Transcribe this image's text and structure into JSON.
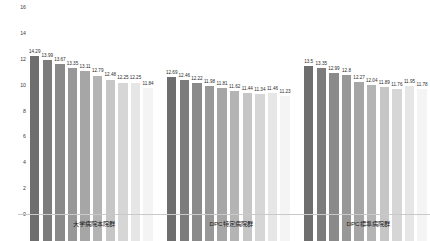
{
  "chart_data": {
    "type": "bar",
    "title": "",
    "xlabel": "",
    "ylabel": "",
    "ylim": [
      0,
      16
    ],
    "grid": false,
    "legend": "none",
    "y_ticks": [
      "0",
      "2",
      "4",
      "6",
      "8",
      "10",
      "12",
      "14",
      "16"
    ],
    "groups": [
      {
        "name": "大学病院本院群",
        "categories": [
          "1",
          "2",
          "3",
          "4",
          "5",
          "6",
          "7",
          "8",
          "9",
          "10"
        ],
        "values": [
          14.29,
          13.99,
          13.67,
          13.35,
          13.11,
          12.79,
          12.48,
          12.25,
          12.25,
          11.84
        ],
        "labels": [
          "14.29",
          "13.99",
          "13.67",
          "13.35",
          "13.11",
          "12.79",
          "12.48",
          "12.25",
          "12.25",
          "11.84"
        ],
        "colors": [
          "#6e6e6e",
          "#7c7c7c",
          "#8a8a8a",
          "#989898",
          "#a6a6a6",
          "#b4b4b4",
          "#c6c6c6",
          "#d6d6d6",
          "#e6e6e6",
          "#f4f4f4"
        ]
      },
      {
        "name": "DPC特定病院群",
        "categories": [
          "1",
          "2",
          "3",
          "4",
          "5",
          "6",
          "7",
          "8",
          "9",
          "10"
        ],
        "values": [
          12.69,
          12.46,
          12.22,
          11.98,
          11.81,
          11.62,
          11.44,
          11.34,
          11.46,
          11.23
        ],
        "labels": [
          "12.69",
          "12.46",
          "12.22",
          "11.98",
          "11.81",
          "11.62",
          "11.44",
          "11.34",
          "11.46",
          "11.23"
        ],
        "colors": [
          "#6e6e6e",
          "#7c7c7c",
          "#8a8a8a",
          "#989898",
          "#a6a6a6",
          "#b4b4b4",
          "#c6c6c6",
          "#d6d6d6",
          "#e6e6e6",
          "#f4f4f4"
        ]
      },
      {
        "name": "DPC標準病院群",
        "categories": [
          "1",
          "2",
          "3",
          "4",
          "5",
          "6",
          "7",
          "8",
          "9",
          "10"
        ],
        "values": [
          13.5,
          13.35,
          12.99,
          12.8,
          12.27,
          12.04,
          11.89,
          11.76,
          11.95,
          11.78
        ],
        "labels": [
          "13.5",
          "13.35",
          "12.99",
          "12.8",
          "12.27",
          "12.04",
          "11.89",
          "11.76",
          "11.95",
          "11.78"
        ],
        "colors": [
          "#6e6e6e",
          "#7c7c7c",
          "#8a8a8a",
          "#989898",
          "#a6a6a6",
          "#b4b4b4",
          "#c6c6c6",
          "#d6d6d6",
          "#e6e6e6",
          "#f4f4f4"
        ]
      }
    ]
  }
}
